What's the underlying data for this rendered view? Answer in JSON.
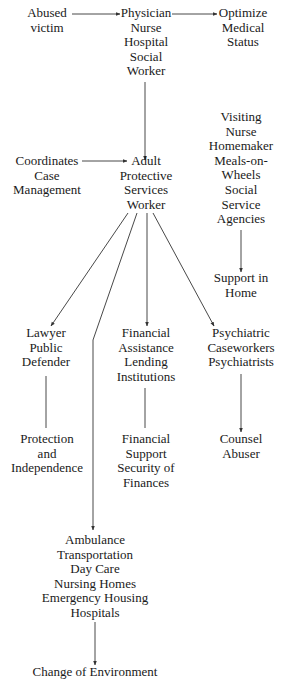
{
  "diagram": {
    "type": "flowchart",
    "nodes": {
      "abused_victim": [
        "Abused",
        "victim"
      ],
      "physician": [
        "Physician",
        "Nurse",
        "Hospital",
        "Social",
        "Worker"
      ],
      "optimize": [
        "Optimize",
        "Medical",
        "Status"
      ],
      "visiting": [
        "Visiting",
        "Nurse",
        "Homemaker",
        "Meals-on-",
        "Wheels",
        "Social",
        "Service",
        "Agencies"
      ],
      "coordinates": [
        "Coordinates",
        "Case",
        "Management"
      ],
      "aps_worker": [
        "Adult",
        "Protective",
        "Services",
        "Worker"
      ],
      "support_home": [
        "Support in",
        "Home"
      ],
      "lawyer": [
        "Lawyer",
        "Public",
        "Defender"
      ],
      "financial_assist": [
        "Financial",
        "Assistance",
        "Lending",
        "Institutions"
      ],
      "psychiatric": [
        "Psychiatric",
        "Caseworkers",
        "Psychiatrists"
      ],
      "protection": [
        "Protection",
        "and",
        "Independence"
      ],
      "financial_support": [
        "Financial",
        "Support",
        "Security of",
        "Finances"
      ],
      "counsel": [
        "Counsel",
        "Abuser"
      ],
      "ambulance": [
        "Ambulance",
        "Transportation",
        "Day Care",
        "Nursing Homes",
        "Emergency Housing",
        "Hospitals"
      ],
      "change_env": [
        "Change of Environment"
      ]
    },
    "edges": [
      {
        "from": "abused_victim",
        "to": "physician",
        "arrow": true
      },
      {
        "from": "physician",
        "to": "optimize",
        "arrow": true
      },
      {
        "from": "physician",
        "to": "aps_worker",
        "arrow": true
      },
      {
        "from": "coordinates",
        "to": "aps_worker",
        "arrow": true
      },
      {
        "from": "visiting",
        "to": "support_home",
        "arrow": true
      },
      {
        "from": "aps_worker",
        "to": "lawyer",
        "arrow": true
      },
      {
        "from": "aps_worker",
        "to": "ambulance",
        "arrow": true
      },
      {
        "from": "aps_worker",
        "to": "financial_assist",
        "arrow": true
      },
      {
        "from": "aps_worker",
        "to": "psychiatric",
        "arrow": true
      },
      {
        "from": "lawyer",
        "to": "protection",
        "arrow": false
      },
      {
        "from": "financial_assist",
        "to": "financial_support",
        "arrow": false
      },
      {
        "from": "psychiatric",
        "to": "counsel",
        "arrow": true
      },
      {
        "from": "ambulance",
        "to": "change_env",
        "arrow": true
      }
    ]
  }
}
